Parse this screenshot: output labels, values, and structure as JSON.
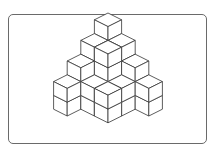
{
  "figure": {
    "frame_color": "#6a6a6a",
    "line_color": "#333333",
    "fill_color": "#ffffff",
    "origin": {
      "x": 108,
      "y": 82
    },
    "edge": {
      "w": 13.6,
      "h": 6.8,
      "v": 13.8
    },
    "heightmap": [
      [
        5,
        4,
        3,
        2
      ],
      [
        4,
        4,
        2,
        0
      ],
      [
        3,
        2,
        2,
        0
      ],
      [
        2,
        0,
        0,
        0
      ]
    ]
  }
}
